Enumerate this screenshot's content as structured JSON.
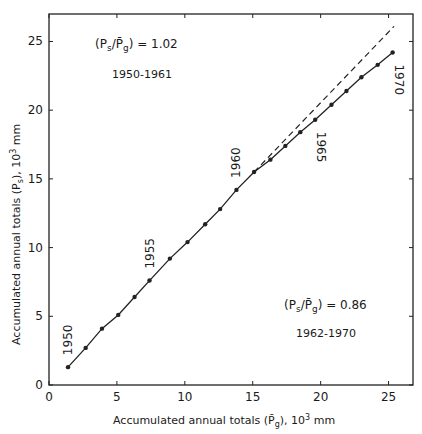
{
  "chart_data": {
    "type": "line",
    "title": "",
    "xlabel": "Accumulated annual totals (P̄g), 10³ mm",
    "ylabel": "Accumulated annual totals (Ps), 10³ mm",
    "xlabel_parts": {
      "main": "Accumulated annual totals (",
      "sym": "P̄",
      "sub": "g",
      "tail": "), 10",
      "sup": "3",
      "unit": " mm"
    },
    "ylabel_parts": {
      "main": "Accumulated annual totals (",
      "sym": "P",
      "sub": "s",
      "tail": "), 10",
      "sup": "3",
      "unit": " mm"
    },
    "xlim": [
      0,
      26.8
    ],
    "ylim": [
      0,
      27
    ],
    "xticks": [
      0,
      5,
      10,
      15,
      20,
      25
    ],
    "yticks": [
      0,
      5,
      10,
      15,
      20,
      25
    ],
    "xtick_labels": [
      "0",
      "5",
      "10",
      "15",
      "20",
      "25"
    ],
    "ytick_labels": [
      "0",
      "5",
      "10",
      "15",
      "20",
      "25"
    ],
    "grid": false,
    "series": [
      {
        "name": "Double mass curve",
        "style": "solid-with-markers",
        "years": [
          1950,
          1951,
          1952,
          1953,
          1954,
          1955,
          1956,
          1957,
          1958,
          1959,
          1960,
          1961,
          1962,
          1963,
          1964,
          1965,
          1966,
          1967,
          1968,
          1969,
          1970
        ],
        "x": [
          1.4,
          2.7,
          3.9,
          5.1,
          6.3,
          7.4,
          8.9,
          10.2,
          11.5,
          12.6,
          13.8,
          15.1,
          16.3,
          17.4,
          18.5,
          19.6,
          20.8,
          21.9,
          23.0,
          24.2,
          25.3
        ],
        "y": [
          1.3,
          2.7,
          4.1,
          5.1,
          6.4,
          7.6,
          9.2,
          10.4,
          11.7,
          12.8,
          14.2,
          15.5,
          16.4,
          17.4,
          18.4,
          19.3,
          20.4,
          21.4,
          22.4,
          23.3,
          24.2
        ]
      },
      {
        "name": "Extension of 1950-1961 trend",
        "style": "dashed",
        "x": [
          15.1,
          25.4
        ],
        "y": [
          15.5,
          26.1
        ]
      }
    ],
    "annotations": [
      {
        "text": "1950",
        "x": 1.4,
        "y": 1.3,
        "rotation": -90
      },
      {
        "text": "1955",
        "x": 7.4,
        "y": 7.6,
        "rotation": -90
      },
      {
        "text": "1960",
        "x": 13.8,
        "y": 14.2,
        "rotation": -90
      },
      {
        "text": "1965",
        "x": 19.6,
        "y": 19.3,
        "rotation": 90
      },
      {
        "text": "1970",
        "x": 25.3,
        "y": 24.2,
        "rotation": 90
      },
      {
        "text": "(Ps/P̄g) = 1.02",
        "period": "1950-1961"
      },
      {
        "text": "(Ps/P̄g) = 0.86",
        "period": "1962-1970"
      }
    ]
  },
  "labels": {
    "ratio1_value": ") = 1.02",
    "ratio1_period": "1950-1961",
    "ratio2_value": ") = 0.86",
    "ratio2_period": "1962-1970",
    "ratio_P": "P",
    "ratio_s": "s",
    "ratio_slash": "/",
    "ratio_Pbar": "P̄",
    "ratio_g": "g",
    "open_paren": "("
  }
}
